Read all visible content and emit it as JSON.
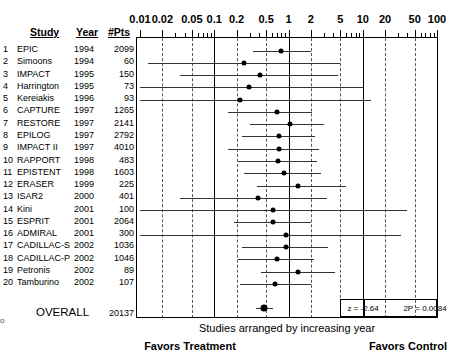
{
  "table": {
    "headers": {
      "study": "Study",
      "year": "Year",
      "pts": "#Pts"
    },
    "rows": [
      {
        "n": "1",
        "name": "EPIC",
        "year": "1994",
        "pts": "2099"
      },
      {
        "n": "2",
        "name": "Simoons",
        "year": "1994",
        "pts": "60"
      },
      {
        "n": "3",
        "name": "IMPACT",
        "year": "1995",
        "pts": "150"
      },
      {
        "n": "4",
        "name": "Harrington",
        "year": "1995",
        "pts": "73"
      },
      {
        "n": "5",
        "name": "Kereiakis",
        "year": "1996",
        "pts": "93"
      },
      {
        "n": "6",
        "name": "CAPTURE",
        "year": "1997",
        "pts": "1265"
      },
      {
        "n": "7",
        "name": "RESTORE",
        "year": "1997",
        "pts": "2141"
      },
      {
        "n": "8",
        "name": "EPILOG",
        "year": "1997",
        "pts": "2792"
      },
      {
        "n": "9",
        "name": "IMPACT II",
        "year": "1997",
        "pts": "4010"
      },
      {
        "n": "10",
        "name": "RAPPORT",
        "year": "1998",
        "pts": "483"
      },
      {
        "n": "11",
        "name": "EPISTENT",
        "year": "1998",
        "pts": "1603"
      },
      {
        "n": "12",
        "name": "ERASER",
        "year": "1999",
        "pts": "225"
      },
      {
        "n": "13",
        "name": "ISAR2",
        "year": "2000",
        "pts": "401"
      },
      {
        "n": "14",
        "name": "Kini",
        "year": "2001",
        "pts": "100"
      },
      {
        "n": "15",
        "name": "ESPRIT",
        "year": "2001",
        "pts": "2064"
      },
      {
        "n": "16",
        "name": "ADMIRAL",
        "year": "2001",
        "pts": "300"
      },
      {
        "n": "17",
        "name": "CADILLAC-S",
        "year": "2002",
        "pts": "1036"
      },
      {
        "n": "18",
        "name": "CADILLAC-P",
        "year": "2002",
        "pts": "1046"
      },
      {
        "n": "19",
        "name": "Petronis",
        "year": "2002",
        "pts": "89"
      },
      {
        "n": "20",
        "name": "Tamburino",
        "year": "2002",
        "pts": "107"
      }
    ],
    "overall": {
      "label": "OVERALL",
      "pts": "20137"
    }
  },
  "stats": {
    "z": "z = -2.64",
    "p": "2P = 0.0084"
  },
  "captions": {
    "main": "Studies arranged by increasing year",
    "left": "Favors Treatment",
    "right": "Favors Control"
  },
  "edge_artifact": "o",
  "chart_data": {
    "type": "forest",
    "title": "",
    "xlabel": "Odds ratio (log scale)",
    "ylabel": "",
    "xscale": "log",
    "xlim": [
      0.01,
      100
    ],
    "xticks": [
      0.01,
      0.02,
      0.05,
      0.1,
      0.2,
      0.5,
      1,
      2,
      5,
      10,
      20,
      50,
      100
    ],
    "xticklabels": [
      "0.01",
      "0.02",
      "0.05",
      "0.1",
      "0.2",
      "0.5",
      "1",
      "2",
      "5",
      "10",
      "20",
      "50",
      "100"
    ],
    "gridlines_dashed_at": [
      0.02,
      0.05,
      0.2,
      0.5,
      2,
      5,
      20,
      50
    ],
    "gridlines_solid_at": [
      0.1,
      1,
      10
    ],
    "reference_line": 1,
    "legend": "none",
    "grid": true,
    "studies": [
      {
        "label": "EPIC",
        "or": 0.8,
        "lo": 0.33,
        "hi": 2.0
      },
      {
        "label": "Simoons",
        "or": 0.25,
        "lo": 0.013,
        "hi": 5.0
      },
      {
        "label": "IMPACT",
        "or": 0.41,
        "lo": 0.035,
        "hi": 4.7
      },
      {
        "label": "Harrington",
        "or": 0.29,
        "lo": 0.01,
        "hi": 10.0
      },
      {
        "label": "Kereiakis",
        "or": 0.22,
        "lo": 0.01,
        "hi": 13.0
      },
      {
        "label": "CAPTURE",
        "or": 0.7,
        "lo": 0.155,
        "hi": 2.1
      },
      {
        "label": "RESTORE",
        "or": 1.05,
        "lo": 0.3,
        "hi": 3.0
      },
      {
        "label": "EPILOG",
        "or": 0.75,
        "lo": 0.24,
        "hi": 2.3
      },
      {
        "label": "IMPACT II",
        "or": 0.74,
        "lo": 0.155,
        "hi": 2.6
      },
      {
        "label": "RAPPORT",
        "or": 0.72,
        "lo": 0.21,
        "hi": 2.4
      },
      {
        "label": "EPISTENT",
        "or": 0.86,
        "lo": 0.25,
        "hi": 2.7
      },
      {
        "label": "ERASER",
        "or": 1.35,
        "lo": 0.38,
        "hi": 6.0
      },
      {
        "label": "ISAR2",
        "or": 0.39,
        "lo": 0.035,
        "hi": 3.3
      },
      {
        "label": "Kini",
        "or": 0.62,
        "lo": 0.01,
        "hi": 40.0
      },
      {
        "label": "ESPRIT",
        "or": 0.61,
        "lo": 0.185,
        "hi": 2.0
      },
      {
        "label": "ADMIRAL",
        "or": 0.92,
        "lo": 0.01,
        "hi": 33.0
      },
      {
        "label": "CADILLAC-S",
        "or": 0.93,
        "lo": 0.24,
        "hi": 3.4
      },
      {
        "label": "CADILLAC-P",
        "or": 0.7,
        "lo": 0.21,
        "hi": 2.2
      },
      {
        "label": "Petronis",
        "or": 1.35,
        "lo": 0.43,
        "hi": 4.2
      },
      {
        "label": "Tamburino",
        "or": 0.66,
        "lo": 0.22,
        "hi": 2.0
      }
    ],
    "overall": {
      "label": "OVERALL",
      "or": 0.47,
      "lo": 0.36,
      "hi": 0.62
    }
  }
}
